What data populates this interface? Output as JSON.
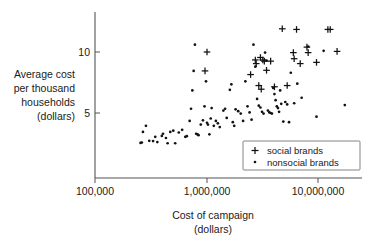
{
  "chart_data": {
    "type": "scatter",
    "title": "",
    "xlabel": "Cost of campaign (dollars)",
    "xlabel_line1": "Cost of campaign",
    "xlabel_line2": "(dollars)",
    "ylabel": "Average cost per thousand households (dollars)",
    "ylabel_lines": [
      "Average cost",
      "per thousand",
      "households",
      "(dollars)"
    ],
    "xscale": "log",
    "yscale": "linear",
    "xlim": [
      100000,
      20000000
    ],
    "ylim": [
      1.6,
      12.6
    ],
    "xticks": [
      100000,
      1000000,
      10000000
    ],
    "xticklabels": [
      "100,000",
      "1,000,000",
      "10,000,000"
    ],
    "yticks": [
      5,
      10
    ],
    "yticklabels": [
      "5",
      "10"
    ],
    "grid": false,
    "legend_position": "lower right",
    "legend": [
      {
        "label": "social brands",
        "marker": "plus"
      },
      {
        "label": "nonsocial brands",
        "marker": "dot"
      }
    ],
    "series": [
      {
        "name": "nonsocial brands",
        "marker": "dot",
        "color": "#111111",
        "points": [
          [
            255000,
            2.55
          ],
          [
            262000,
            2.58
          ],
          [
            268000,
            3.45
          ],
          [
            285000,
            3.95
          ],
          [
            305000,
            2.72
          ],
          [
            330000,
            2.7
          ],
          [
            345000,
            3.05
          ],
          [
            360000,
            2.62
          ],
          [
            395000,
            3.12
          ],
          [
            405000,
            3.3
          ],
          [
            430000,
            2.95
          ],
          [
            445000,
            2.52
          ],
          [
            470000,
            3.45
          ],
          [
            500000,
            3.55
          ],
          [
            520000,
            2.52
          ],
          [
            560000,
            3.4
          ],
          [
            600000,
            3.62
          ],
          [
            640000,
            3.05
          ],
          [
            660000,
            3.1
          ],
          [
            700000,
            4.35
          ],
          [
            720000,
            5.35
          ],
          [
            740000,
            6.85
          ],
          [
            760000,
            8.45
          ],
          [
            780000,
            10.6
          ],
          [
            800000,
            3.3
          ],
          [
            820000,
            3.25
          ],
          [
            840000,
            3.18
          ],
          [
            880000,
            4.05
          ],
          [
            920000,
            4.4
          ],
          [
            950000,
            5.55
          ],
          [
            980000,
            7.6
          ],
          [
            1000000,
            4.2
          ],
          [
            1020000,
            4.05
          ],
          [
            1050000,
            3.25
          ],
          [
            1080000,
            4.55
          ],
          [
            1100000,
            5.4
          ],
          [
            1150000,
            3.95
          ],
          [
            1200000,
            4.35
          ],
          [
            1250000,
            4.15
          ],
          [
            1300000,
            3.85
          ],
          [
            1400000,
            5.2
          ],
          [
            1450000,
            5.35
          ],
          [
            1500000,
            4.6
          ],
          [
            1600000,
            6.9
          ],
          [
            1650000,
            7.35
          ],
          [
            1700000,
            4.25
          ],
          [
            1750000,
            3.95
          ],
          [
            1800000,
            5.3
          ],
          [
            1900000,
            5.15
          ],
          [
            2000000,
            4.95
          ],
          [
            2100000,
            4.35
          ],
          [
            2200000,
            7.6
          ],
          [
            2300000,
            5.55
          ],
          [
            2400000,
            5.05
          ],
          [
            2500000,
            4.45
          ],
          [
            2600000,
            10.6
          ],
          [
            2700000,
            8.8
          ],
          [
            2800000,
            6.15
          ],
          [
            2900000,
            5.6
          ],
          [
            3000000,
            5.45
          ],
          [
            3100000,
            5.1
          ],
          [
            3200000,
            4.95
          ],
          [
            3300000,
            9.95
          ],
          [
            3400000,
            9.3
          ],
          [
            3500000,
            5.2
          ],
          [
            3600000,
            5.05
          ],
          [
            3700000,
            5.0
          ],
          [
            3800000,
            4.95
          ],
          [
            3900000,
            7.05
          ],
          [
            4000000,
            6.55
          ],
          [
            4100000,
            6.05
          ],
          [
            4200000,
            5.55
          ],
          [
            4300000,
            5.4
          ],
          [
            4400000,
            5.1
          ],
          [
            4500000,
            6.85
          ],
          [
            4600000,
            5.75
          ],
          [
            4800000,
            4.3
          ],
          [
            5000000,
            5.9
          ],
          [
            5200000,
            5.7
          ],
          [
            5400000,
            4.25
          ],
          [
            5600000,
            8.3
          ],
          [
            6000000,
            5.8
          ],
          [
            6400000,
            7.4
          ],
          [
            7000000,
            6.25
          ],
          [
            8000000,
            10.45
          ],
          [
            9500000,
            4.7
          ],
          [
            11000000,
            10.1
          ],
          [
            17000000,
            5.65
          ]
        ]
      },
      {
        "name": "social brands",
        "marker": "plus",
        "color": "#111111",
        "points": [
          [
            1000000,
            10.0
          ],
          [
            960000,
            8.45
          ],
          [
            2450000,
            8.15
          ],
          [
            2700000,
            9.35
          ],
          [
            2750000,
            9.05
          ],
          [
            2900000,
            7.25
          ],
          [
            3000000,
            9.55
          ],
          [
            3050000,
            6.95
          ],
          [
            3150000,
            9.35
          ],
          [
            3250000,
            9.25
          ],
          [
            3400000,
            8.5
          ],
          [
            3700000,
            9.25
          ],
          [
            4000000,
            7.15
          ],
          [
            4700000,
            11.9
          ],
          [
            5200000,
            7.25
          ],
          [
            5900000,
            9.95
          ],
          [
            6000000,
            9.45
          ],
          [
            6300000,
            11.85
          ],
          [
            6800000,
            9.05
          ],
          [
            7800000,
            10.4
          ],
          [
            8000000,
            9.95
          ],
          [
            9500000,
            9.15
          ],
          [
            12000000,
            11.85
          ],
          [
            12600000,
            11.85
          ],
          [
            14500000,
            10.05
          ]
        ]
      }
    ]
  },
  "axes": {
    "x_tick_labels": [
      "100,000",
      "1,000,000",
      "10,000,000"
    ],
    "y_tick_labels": [
      "10",
      "5"
    ]
  },
  "legend": {
    "social_label": "social brands",
    "nonsocial_label": "nonsocial brands"
  },
  "labels": {
    "y_line1": "Average cost",
    "y_line2": "per thousand",
    "y_line3": "households",
    "y_line4": "(dollars)",
    "x_line1": "Cost of campaign",
    "x_line2": "(dollars)"
  }
}
